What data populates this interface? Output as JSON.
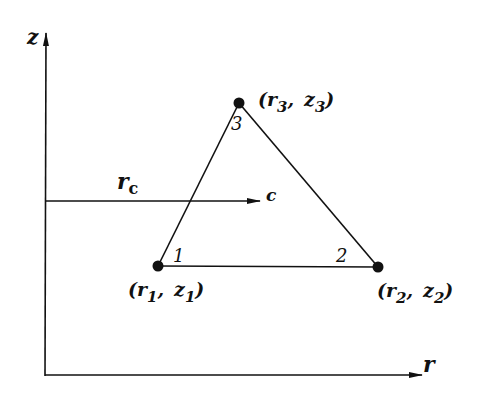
{
  "diagram": {
    "type": "triangular-element-axisymmetric",
    "axes": {
      "vertical_label": "z",
      "horizontal_label": "r"
    },
    "centroid_arrow": {
      "distance_label": "r",
      "distance_subscript": "c",
      "point_label": "c"
    },
    "nodes": [
      {
        "id": "1",
        "number": "1",
        "coord_r": "r",
        "coord_r_sub": "1",
        "coord_z": "z",
        "coord_z_sub": "1",
        "x": 158,
        "y": 266
      },
      {
        "id": "2",
        "number": "2",
        "coord_r": "r",
        "coord_r_sub": "2",
        "coord_z": "z",
        "coord_z_sub": "2",
        "x": 378,
        "y": 267
      },
      {
        "id": "3",
        "number": "3",
        "coord_r": "r",
        "coord_r_sub": "3",
        "coord_z": "z",
        "coord_z_sub": "3",
        "x": 239,
        "y": 103
      }
    ],
    "punctuation": {
      "open": "(",
      "comma": ",",
      "close": ")"
    },
    "colors": {
      "ink": "#111111",
      "background": "#ffffff"
    }
  }
}
